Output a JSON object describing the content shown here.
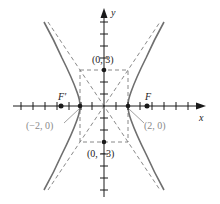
{
  "diagram": {
    "type": "hyperbola",
    "equation": "x^2/4 - y^2/9 = 1",
    "axes": {
      "x_label": "x",
      "y_label": "y"
    },
    "points": {
      "top_covertex": {
        "label": "(0, 3)",
        "x": 0,
        "y": 3
      },
      "bottom_covertex": {
        "label": "(0, −3)",
        "x": 0,
        "y": -3
      },
      "left_vertex": {
        "label": "(−2, 0)",
        "x": -2,
        "y": 0
      },
      "right_vertex": {
        "label": "(2, 0)",
        "x": 2,
        "y": 0
      },
      "left_focus": {
        "label": "F′"
      },
      "right_focus": {
        "label": "F"
      }
    },
    "colors": {
      "curve": "#6f6f6f",
      "axis": "#1a1a1a",
      "dashed": "#7a7a7a",
      "label_gray": "#8a8a8a"
    }
  }
}
